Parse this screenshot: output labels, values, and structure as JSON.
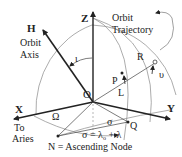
{
  "diagram": {
    "labels": {
      "z_axis": "Z",
      "h_vector": "H",
      "orbit_axis_line1": "Orbit",
      "orbit_axis_line2": "Axis",
      "inclination": "ι",
      "orbit_traj_line1": "Orbit",
      "orbit_traj_line2": "Trajectory",
      "r_point": "R",
      "upsilon": "υ",
      "p_point": "P",
      "l_label": "L",
      "origin": "O",
      "x_axis": "X",
      "to_aries_line1": "To",
      "to_aries_line2": "Aries",
      "omega": "Ω",
      "sigma_arc": "σ",
      "q_point": "Q",
      "y_axis": "Y",
      "sigma_formula": "σ = λ",
      "sigma_formula_sub": "o",
      "sigma_formula_tail": " + λ",
      "node_caption": "N = Ascending  Node"
    },
    "colors": {
      "line": "#222222",
      "thin": "#777777",
      "text": "#222222"
    }
  }
}
